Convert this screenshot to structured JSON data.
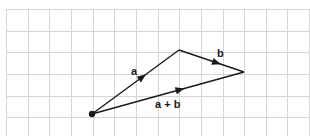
{
  "diagram": {
    "type": "vector-addition",
    "grid": {
      "x0": 6,
      "y0": 9,
      "cell": 21.65,
      "cols": 14,
      "rows": 6,
      "line_color": "#d6d6d6"
    },
    "colors": {
      "vector": "#1a1a1a",
      "background": "#ffffff"
    },
    "points": {
      "origin": {
        "x": 92,
        "y": 114
      },
      "apex": {
        "x": 179,
        "y": 50
      },
      "tip": {
        "x": 244,
        "y": 72
      }
    },
    "vectors": [
      {
        "id": "a",
        "label": "a",
        "from": "origin",
        "to": "apex",
        "label_x": 131,
        "label_y": 75
      },
      {
        "id": "b",
        "label": "b",
        "from": "apex",
        "to": "tip",
        "label_x": 217,
        "label_y": 57
      },
      {
        "id": "a_plus_b",
        "label": "a + b",
        "from": "origin",
        "to": "tip",
        "label_x": 155,
        "label_y": 108
      }
    ]
  }
}
